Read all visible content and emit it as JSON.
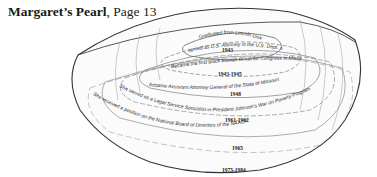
{
  "caption": {
    "title": "Margaret’s Pearl",
    "separator": ", ",
    "page": "Page 13"
  },
  "illustration": {
    "subject": "clam-shell",
    "rings": [
      {
        "text": "Graduated from Lincoln University School of Law",
        "year": "1943"
      },
      {
        "text": "served as U.S. Attorney in the U.S. Dept. of Agriculture",
        "year": "1943-1945"
      },
      {
        "text": "Became the first black woman to run for Congress in Missouri",
        "year": "1948"
      },
      {
        "text": "became Assistant Attorney General of the State of Missouri",
        "year": "1961-1962"
      },
      {
        "text": "She served as a Legal Service Specialist in President Johnson's War on Poverty Program",
        "year": "1965"
      },
      {
        "text": "She received a position on the National Board of Directors of the NAACP",
        "year": "1975-1984"
      }
    ]
  }
}
